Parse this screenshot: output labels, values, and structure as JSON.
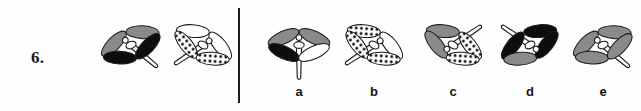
{
  "question": {
    "number": "6.",
    "type": "visual-analogy-multiple-choice"
  },
  "divider": {
    "orientation": "vertical"
  },
  "samples": [
    {
      "id": "sample-1",
      "name": "dragonfly-sample-1",
      "x": 88,
      "y": 12,
      "rotation": -22,
      "tail_direction": "down-right",
      "wings": {
        "upper_left": "gray",
        "upper_right": "gray",
        "lower_left": "black",
        "lower_right": "black"
      }
    },
    {
      "id": "sample-2",
      "name": "dragonfly-sample-2",
      "x": 160,
      "y": 12,
      "rotation": 28,
      "tail_direction": "down-left",
      "wings": {
        "upper_left": "white",
        "upper_right": "white",
        "lower_left": "dotted",
        "lower_right": "dotted"
      }
    }
  ],
  "options": [
    {
      "id": "option-a",
      "label": "a",
      "x": 256,
      "y": 12,
      "rotation": 0,
      "tail_direction": "down",
      "wings": {
        "upper_left": "gray",
        "upper_right": "gray",
        "lower_left": "black",
        "lower_right": "white"
      }
    },
    {
      "id": "option-b",
      "label": "b",
      "x": 331,
      "y": 12,
      "rotation": 28,
      "tail_direction": "down-left",
      "wings": {
        "upper_left": "dotted",
        "upper_right": "white",
        "lower_left": "dotted",
        "lower_right": "dotted"
      }
    },
    {
      "id": "option-c",
      "label": "c",
      "x": 410,
      "y": 12,
      "rotation": 28,
      "tail_direction": "up-right",
      "wings": {
        "upper_left": "gray",
        "upper_right": "dotted",
        "lower_left": "gray",
        "lower_right": "dotted"
      }
    },
    {
      "id": "option-d",
      "label": "d",
      "x": 487,
      "y": 12,
      "rotation": -28,
      "tail_direction": "up-left",
      "wings": {
        "upper_left": "black",
        "upper_right": "black",
        "lower_left": "gray",
        "lower_right": "black"
      }
    },
    {
      "id": "option-e",
      "label": "e",
      "x": 560,
      "y": 12,
      "rotation": -22,
      "tail_direction": "down-right",
      "wings": {
        "upper_left": "gray",
        "upper_right": "gray",
        "lower_left": "gray",
        "lower_right": "gray"
      }
    }
  ],
  "colors": {
    "ink": "#1d1d1d",
    "gray_wing": "#8a8a8a",
    "black_wing": "#0d0d0d",
    "white_wing": "#ffffff",
    "dot": "#111111",
    "background": "#fefefe"
  }
}
